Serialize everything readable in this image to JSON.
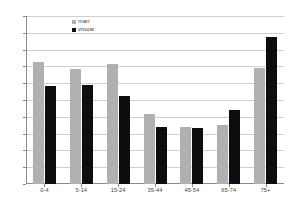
{
  "chart_data": {
    "type": "bar",
    "title": "",
    "subtitle": "",
    "xlabel": "",
    "ylabel": "",
    "categories": [
      "0-4",
      "5-14",
      "15-24",
      "35-44",
      "45-54",
      "65-74",
      "75+"
    ],
    "series": [
      {
        "name": "man",
        "color": "#b0b0b0",
        "values": [
          145,
          137,
          143,
          83,
          68,
          70,
          138
        ]
      },
      {
        "name": "vrouw",
        "color": "#0d0d0d",
        "values": [
          117,
          118,
          105,
          68,
          67,
          88,
          175
        ]
      }
    ],
    "ylim": [
      0,
      200
    ],
    "ytick_step": 20,
    "yticks": [
      "0",
      "20",
      "40",
      "60",
      "80",
      "100",
      "120",
      "140",
      "160",
      "180",
      "200"
    ],
    "grid": true,
    "legend_position": "top-left-inside"
  },
  "legend": {
    "items": [
      {
        "label": "man",
        "color": "#b0b0b0"
      },
      {
        "label": "vrouw",
        "color": "#0d0d0d"
      }
    ]
  },
  "colors": {
    "man": "#b0b0b0",
    "vrouw": "#0d0d0d",
    "gridline": "#cfcfcf",
    "axis": "#8a8a8a",
    "tick_text": "#555555",
    "background": "#ffffff"
  }
}
